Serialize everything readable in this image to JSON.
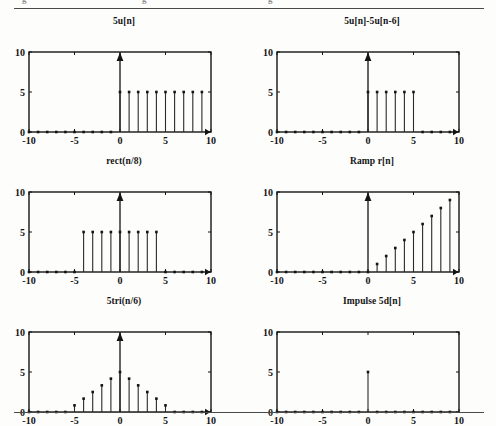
{
  "page": {
    "clipped_top_text": [
      "g",
      "g",
      "g"
    ],
    "rules": [
      "top-rule",
      "bottom-rule"
    ]
  },
  "axis": {
    "xlim": [
      -10,
      10
    ],
    "ylim": [
      0,
      10
    ],
    "xticks": [
      -10,
      -5,
      0,
      5,
      10
    ],
    "xtick_labels": [
      "-10",
      "-5",
      "0",
      "5",
      "10"
    ],
    "yticks": [
      0,
      5,
      10
    ],
    "ytick_labels": [
      "0",
      "5",
      "10"
    ],
    "grid": false,
    "frame_color": "#141414",
    "stem_color": "#2a2a2a",
    "marker_color": "#141414"
  },
  "chart_data": [
    {
      "id": "plot-5un",
      "type": "stem",
      "title": "5u[n]",
      "xlabel": "",
      "ylabel": "",
      "xlim": [
        -10,
        10
      ],
      "ylim": [
        0,
        10
      ],
      "xticks": [
        -10,
        -5,
        0,
        5,
        10
      ],
      "yticks": [
        0,
        5,
        10
      ],
      "y_axis_arrow": true,
      "x_axis_arrow": true,
      "x": [
        -10,
        -9,
        -8,
        -7,
        -6,
        -5,
        -4,
        -3,
        -2,
        -1,
        0,
        1,
        2,
        3,
        4,
        5,
        6,
        7,
        8,
        9
      ],
      "values": [
        0,
        0,
        0,
        0,
        0,
        0,
        0,
        0,
        0,
        0,
        5,
        5,
        5,
        5,
        5,
        5,
        5,
        5,
        5,
        5
      ]
    },
    {
      "id": "plot-5un-minus-5un6",
      "type": "stem",
      "title": "5u[n]-5u[n-6]",
      "xlabel": "",
      "ylabel": "",
      "xlim": [
        -10,
        10
      ],
      "ylim": [
        0,
        10
      ],
      "xticks": [
        -10,
        -5,
        0,
        5,
        10
      ],
      "yticks": [
        0,
        5,
        10
      ],
      "y_axis_arrow": true,
      "x_axis_arrow": true,
      "x": [
        -10,
        -9,
        -8,
        -7,
        -6,
        -5,
        -4,
        -3,
        -2,
        -1,
        0,
        1,
        2,
        3,
        4,
        5,
        6,
        7,
        8,
        9
      ],
      "values": [
        0,
        0,
        0,
        0,
        0,
        0,
        0,
        0,
        0,
        0,
        5,
        5,
        5,
        5,
        5,
        5,
        0,
        0,
        0,
        0
      ]
    },
    {
      "id": "plot-rect-n-8",
      "type": "stem",
      "title": "rect(n/8)",
      "xlabel": "",
      "ylabel": "",
      "xlim": [
        -10,
        10
      ],
      "ylim": [
        0,
        10
      ],
      "xticks": [
        -10,
        -5,
        0,
        5,
        10
      ],
      "yticks": [
        0,
        5,
        10
      ],
      "y_axis_arrow": true,
      "x_axis_arrow": true,
      "x": [
        -10,
        -9,
        -8,
        -7,
        -6,
        -5,
        -4,
        -3,
        -2,
        -1,
        0,
        1,
        2,
        3,
        4,
        5,
        6,
        7,
        8,
        9
      ],
      "values": [
        0,
        0,
        0,
        0,
        0,
        0,
        5,
        5,
        5,
        5,
        5,
        5,
        5,
        5,
        5,
        0,
        0,
        0,
        0,
        0
      ]
    },
    {
      "id": "plot-ramp-rn",
      "type": "stem",
      "title": "Ramp r[n]",
      "xlabel": "",
      "ylabel": "",
      "xlim": [
        -10,
        10
      ],
      "ylim": [
        0,
        10
      ],
      "xticks": [
        -10,
        -5,
        0,
        5,
        10
      ],
      "yticks": [
        0,
        5,
        10
      ],
      "y_axis_arrow": true,
      "x_axis_arrow": true,
      "x": [
        -10,
        -9,
        -8,
        -7,
        -6,
        -5,
        -4,
        -3,
        -2,
        -1,
        0,
        1,
        2,
        3,
        4,
        5,
        6,
        7,
        8,
        9
      ],
      "values": [
        0,
        0,
        0,
        0,
        0,
        0,
        0,
        0,
        0,
        0,
        0,
        1,
        2,
        3,
        4,
        5,
        6,
        7,
        8,
        9
      ]
    },
    {
      "id": "plot-5tri-n-6",
      "type": "stem",
      "title": "5tri(n/6)",
      "xlabel": "",
      "ylabel": "",
      "xlim": [
        -10,
        10
      ],
      "ylim": [
        0,
        10
      ],
      "xticks": [
        -10,
        -5,
        0,
        5,
        10
      ],
      "yticks": [
        0,
        5,
        10
      ],
      "y_axis_arrow": true,
      "x_axis_arrow": true,
      "x": [
        -10,
        -9,
        -8,
        -7,
        -6,
        -5,
        -4,
        -3,
        -2,
        -1,
        0,
        1,
        2,
        3,
        4,
        5,
        6,
        7,
        8,
        9
      ],
      "values": [
        0,
        0,
        0,
        0,
        0,
        0.83,
        1.67,
        2.5,
        3.33,
        4.17,
        5,
        4.17,
        3.33,
        2.5,
        1.67,
        0.83,
        0,
        0,
        0,
        0
      ]
    },
    {
      "id": "plot-impulse-5dn",
      "type": "stem",
      "title": "Impulse 5d[n]",
      "xlabel": "",
      "ylabel": "",
      "xlim": [
        -10,
        10
      ],
      "ylim": [
        0,
        10
      ],
      "xticks": [
        -10,
        -5,
        0,
        5,
        10
      ],
      "yticks": [
        0,
        5,
        10
      ],
      "y_axis_arrow": false,
      "x_axis_arrow": false,
      "x": [
        -10,
        -9,
        -8,
        -7,
        -6,
        -5,
        -4,
        -3,
        -2,
        -1,
        0,
        1,
        2,
        3,
        4,
        5,
        6,
        7,
        8,
        9
      ],
      "values": [
        0,
        0,
        0,
        0,
        0,
        0,
        0,
        0,
        0,
        0,
        5,
        0,
        0,
        0,
        0,
        0,
        0,
        0,
        0,
        0
      ]
    }
  ]
}
